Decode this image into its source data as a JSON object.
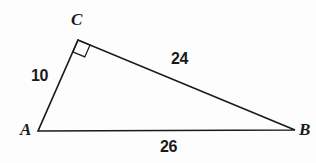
{
  "figure": {
    "type": "right-triangle-diagram",
    "background_color": "#fdfdfd",
    "stroke_color": "#1a1a1a",
    "text_color": "#1a1a1a",
    "vertices": [
      {
        "name": "A",
        "label": "A",
        "x": 38,
        "y": 131
      },
      {
        "name": "B",
        "label": "B",
        "x": 295,
        "y": 130
      },
      {
        "name": "C",
        "label": "C",
        "x": 78,
        "y": 40
      }
    ],
    "sides": [
      {
        "name": "AC",
        "label": "10",
        "from": "A",
        "to": "C"
      },
      {
        "name": "CB",
        "label": "24",
        "from": "C",
        "to": "B"
      },
      {
        "name": "AB",
        "label": "26",
        "from": "A",
        "to": "B"
      }
    ],
    "right_angle": {
      "at_vertex": "C",
      "marker": "right-angle-square",
      "size": 13
    }
  }
}
